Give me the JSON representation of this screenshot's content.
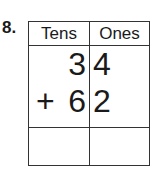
{
  "problem": {
    "number": "8.",
    "columns": {
      "tens_label": "Tens",
      "ones_label": "Ones"
    },
    "addend1": {
      "tens": "3",
      "ones": "4"
    },
    "operator": "+",
    "addend2": {
      "tens": "6",
      "ones": "2"
    },
    "answer": {
      "tens": "",
      "ones": ""
    }
  }
}
